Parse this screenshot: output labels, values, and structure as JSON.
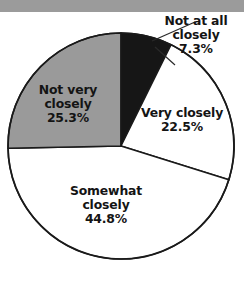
{
  "figure": {
    "background_color": "#ffffff",
    "scan_strip_color": "#9b9b9b"
  },
  "chart_data": {
    "type": "pie",
    "title": "",
    "subtitle": "",
    "xlabel": "",
    "ylabel": "",
    "legend_position": "none",
    "grid": false,
    "start_angle_deg": 0,
    "direction": "clockwise",
    "center": {
      "x": 121,
      "y": 146
    },
    "radius": 113,
    "outline_color": "#1a1a1a",
    "total_percent": 99.9,
    "categories": [
      "Not at all closely",
      "Very closely",
      "Somewhat closely",
      "Not very closely"
    ],
    "values": [
      7.3,
      22.5,
      44.8,
      25.3
    ],
    "slices": [
      {
        "label": "Not at all closely",
        "label_line1": "Not at all",
        "label_line2": "closely",
        "value": 7.3,
        "value_text": "7.3%",
        "color": "#161616",
        "text_color": "#141414",
        "label_placement": "outside",
        "leader_line": true
      },
      {
        "label": "Very closely",
        "label_line1": "Very closely",
        "label_line2": "",
        "value": 22.5,
        "value_text": "22.5%",
        "color": "#ffffff",
        "text_color": "#141414",
        "label_placement": "inside",
        "leader_line": false
      },
      {
        "label": "Somewhat closely",
        "label_line1": "Somewhat",
        "label_line2": "closely",
        "value": 44.8,
        "value_text": "44.8%",
        "color": "#ffffff",
        "text_color": "#141414",
        "label_placement": "inside",
        "leader_line": false
      },
      {
        "label": "Not very closely",
        "label_line1": "Not very",
        "label_line2": "closely",
        "value": 25.3,
        "value_text": "25.3%",
        "color": "#9a9a9a",
        "text_color": "#141414",
        "label_placement": "inside",
        "leader_line": false
      }
    ]
  }
}
